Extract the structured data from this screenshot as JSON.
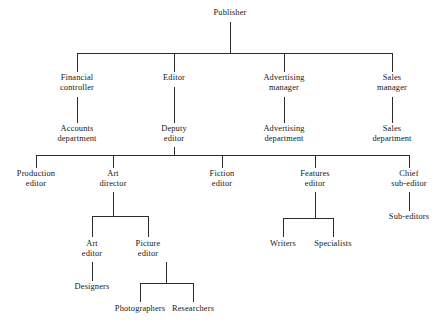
{
  "diagram": {
    "type": "organizational-chart",
    "background_color": "#ffffff",
    "line_color": "#2b2b2b",
    "text_color": "#161616"
  },
  "nodes": {
    "publisher": {
      "label": "Publisher",
      "lines": [
        "Publisher"
      ]
    },
    "financial_controller": {
      "label": "Financial controller",
      "lines": [
        "Financial",
        "controller"
      ]
    },
    "editor": {
      "label": "Editor",
      "lines": [
        "Editor"
      ]
    },
    "advertising_manager": {
      "label": "Advertising manager",
      "lines": [
        "Advertising",
        "manager"
      ]
    },
    "sales_manager": {
      "label": "Sales manager",
      "lines": [
        "Sales",
        "manager"
      ]
    },
    "accounts_department": {
      "label": "Accounts department",
      "lines": [
        "Accounts",
        "department"
      ]
    },
    "deputy_editor": {
      "label": "Deputy editor",
      "lines": [
        "Deputy",
        "editor"
      ]
    },
    "advertising_department": {
      "label": "Advertising department",
      "lines": [
        "Advertising",
        "department"
      ]
    },
    "sales_department": {
      "label": "Sales department",
      "lines": [
        "Sales",
        "department"
      ]
    },
    "production_editor": {
      "label": "Production editor",
      "lines": [
        "Production",
        "editor"
      ]
    },
    "art_director": {
      "label": "Art director",
      "lines": [
        "Art",
        "director"
      ]
    },
    "fiction_editor": {
      "label": "Fiction editor",
      "lines": [
        "Fiction",
        "editor"
      ]
    },
    "features_editor": {
      "label": "Features editor",
      "lines": [
        "Features",
        "editor"
      ]
    },
    "chief_sub_editor": {
      "label": "Chief sub-editor",
      "lines": [
        "Chief",
        "sub-editor"
      ]
    },
    "sub_editors": {
      "label": "Sub-editors",
      "lines": [
        "Sub-editors"
      ]
    },
    "art_editor": {
      "label": "Art editor",
      "lines": [
        "Art",
        "editor"
      ]
    },
    "picture_editor": {
      "label": "Picture editor",
      "lines": [
        "Picture",
        "editor"
      ]
    },
    "writers": {
      "label": "Writers",
      "lines": [
        "Writers"
      ]
    },
    "specialists": {
      "label": "Specialists",
      "lines": [
        "Specialists"
      ]
    },
    "designers": {
      "label": "Designers",
      "lines": [
        "Designers"
      ]
    },
    "photographers": {
      "label": "Photographers",
      "lines": [
        "Photographers"
      ]
    },
    "researchers": {
      "label": "Researchers",
      "lines": [
        "Researchers"
      ]
    }
  },
  "hierarchy": {
    "root": "publisher",
    "edges": [
      {
        "from": "publisher",
        "to": "financial_controller"
      },
      {
        "from": "publisher",
        "to": "editor"
      },
      {
        "from": "publisher",
        "to": "advertising_manager"
      },
      {
        "from": "publisher",
        "to": "sales_manager"
      },
      {
        "from": "financial_controller",
        "to": "accounts_department"
      },
      {
        "from": "editor",
        "to": "deputy_editor"
      },
      {
        "from": "advertising_manager",
        "to": "advertising_department"
      },
      {
        "from": "sales_manager",
        "to": "sales_department"
      },
      {
        "from": "deputy_editor",
        "to": "production_editor"
      },
      {
        "from": "deputy_editor",
        "to": "art_director"
      },
      {
        "from": "deputy_editor",
        "to": "fiction_editor"
      },
      {
        "from": "deputy_editor",
        "to": "features_editor"
      },
      {
        "from": "deputy_editor",
        "to": "chief_sub_editor"
      },
      {
        "from": "chief_sub_editor",
        "to": "sub_editors"
      },
      {
        "from": "art_director",
        "to": "art_editor"
      },
      {
        "from": "art_director",
        "to": "picture_editor"
      },
      {
        "from": "features_editor",
        "to": "writers"
      },
      {
        "from": "features_editor",
        "to": "specialists"
      },
      {
        "from": "art_editor",
        "to": "designers"
      },
      {
        "from": "picture_editor",
        "to": "photographers"
      },
      {
        "from": "picture_editor",
        "to": "researchers"
      }
    ]
  }
}
